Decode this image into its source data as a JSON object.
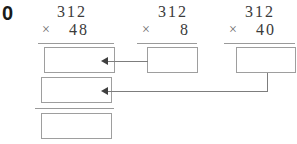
{
  "worksheet": {
    "problem_number": "0",
    "columns": [
      {
        "id": "full-product",
        "multiplicand": "312",
        "operator": "×",
        "multiplier": "48",
        "answer_boxes": [
          "",
          "",
          ""
        ]
      },
      {
        "id": "ones-partial-product",
        "multiplicand": "312",
        "operator": "×",
        "multiplier": "8",
        "answer_boxes": [
          ""
        ]
      },
      {
        "id": "tens-partial-product",
        "multiplicand": "312",
        "operator": "×",
        "multiplier": "40",
        "answer_boxes": [
          ""
        ]
      }
    ],
    "connectors": [
      {
        "id": "ones-to-partial-1",
        "from": "ones-partial-product",
        "to": "full-product-box-1",
        "arrow": "left"
      },
      {
        "id": "tens-to-partial-2",
        "from": "tens-partial-product",
        "to": "full-product-box-2",
        "arrow": "left"
      }
    ],
    "colors": {
      "ink": "#3a3a3a",
      "label_ink": "#1a1a1a",
      "rule": "#9a9a9a",
      "box_border": "#9e9e9e",
      "connector": "#7d7d7d",
      "arrowhead": "#3f3f3f",
      "background": "#ffffff"
    }
  }
}
